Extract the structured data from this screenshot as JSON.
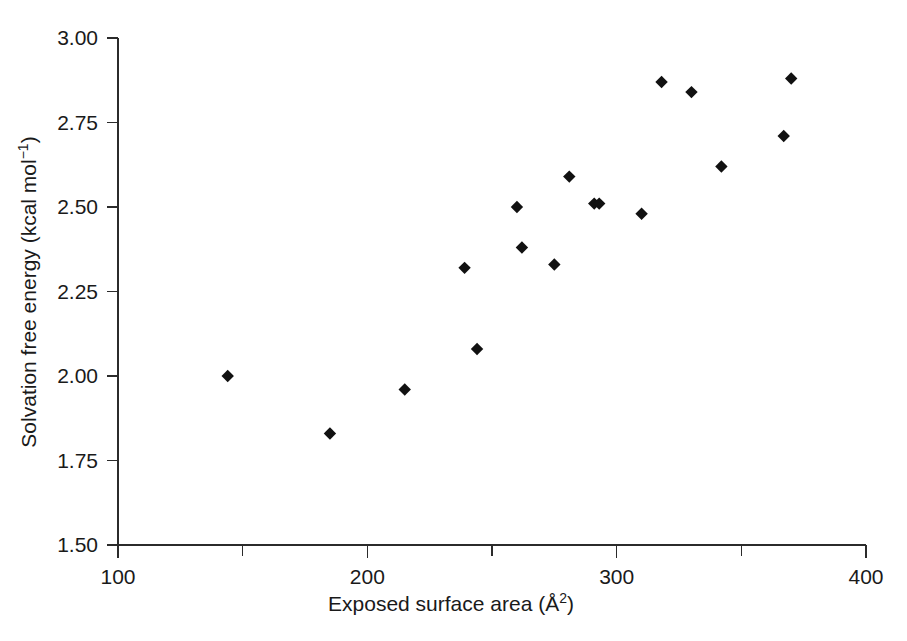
{
  "chart_data": {
    "type": "scatter",
    "title": "",
    "xlabel": "Exposed surface area (Å2)",
    "xlabel_base": "Exposed surface area (Å",
    "xlabel_sup": "2",
    "xlabel_close": ")",
    "ylabel": "Solvation free energy (kcal mol−1)",
    "ylabel_base": "Solvation free energy (kcal mol",
    "ylabel_sup": "−1",
    "ylabel_close": ")",
    "xlim": [
      100,
      400
    ],
    "ylim": [
      1.5,
      3.0
    ],
    "grid": false,
    "legend": null,
    "marker_style": "filled-diamond",
    "marker_color": "#111111",
    "x_major_ticks": [
      100,
      200,
      300,
      400
    ],
    "x_minor_ticks": [
      150,
      250,
      350
    ],
    "x_tick_labels": [
      "100",
      "200",
      "300",
      "400"
    ],
    "y_ticks": [
      1.5,
      1.75,
      2.0,
      2.25,
      2.5,
      2.75,
      3.0
    ],
    "y_tick_labels": [
      "1.50",
      "1.75",
      "2.00",
      "2.25",
      "2.50",
      "2.75",
      "3.00"
    ],
    "points": [
      {
        "x": 144,
        "y": 2.0
      },
      {
        "x": 185,
        "y": 1.83
      },
      {
        "x": 215,
        "y": 1.96
      },
      {
        "x": 239,
        "y": 2.32
      },
      {
        "x": 244,
        "y": 2.08
      },
      {
        "x": 260,
        "y": 2.5
      },
      {
        "x": 262,
        "y": 2.38
      },
      {
        "x": 275,
        "y": 2.33
      },
      {
        "x": 281,
        "y": 2.59
      },
      {
        "x": 291,
        "y": 2.51
      },
      {
        "x": 293,
        "y": 2.51
      },
      {
        "x": 310,
        "y": 2.48
      },
      {
        "x": 318,
        "y": 2.87
      },
      {
        "x": 330,
        "y": 2.84
      },
      {
        "x": 342,
        "y": 2.62
      },
      {
        "x": 367,
        "y": 2.71
      },
      {
        "x": 370,
        "y": 2.88
      }
    ]
  }
}
